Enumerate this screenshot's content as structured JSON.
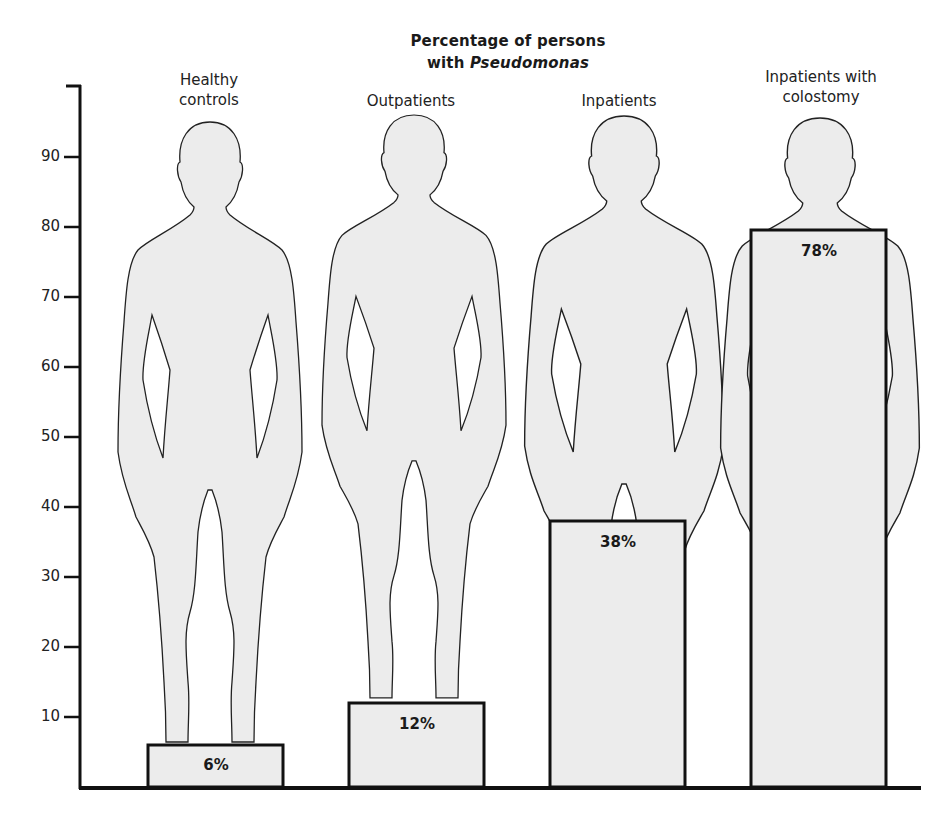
{
  "chart_data": {
    "type": "bar",
    "title": "Percentage of persons with Pseudomonas",
    "title_line1": "Percentage of persons",
    "title_line2_prefix": "with ",
    "title_line2_italic": "Pseudomonas",
    "xlabel": "",
    "ylabel": "",
    "categories": [
      "Healthy controls",
      "Outpatients",
      "Inpatients",
      "Inpatients with colostomy"
    ],
    "category_label_lines": [
      [
        "Healthy",
        "controls"
      ],
      [
        "Outpatients"
      ],
      [
        "Inpatients"
      ],
      [
        "Inpatients with",
        "colostomy"
      ]
    ],
    "values": [
      6,
      12,
      38,
      78
    ],
    "value_labels": [
      "6%",
      "12%",
      "38%",
      "78%"
    ],
    "yticks": [
      10,
      20,
      30,
      40,
      50,
      60,
      70,
      80,
      90
    ],
    "ylim": [
      0,
      100
    ],
    "grid": false,
    "legend": null,
    "style": "pictograph bars overlaid on human silhouettes",
    "colors": {
      "fill": "#ececec",
      "stroke": "#111111",
      "axis": "#111111"
    }
  }
}
